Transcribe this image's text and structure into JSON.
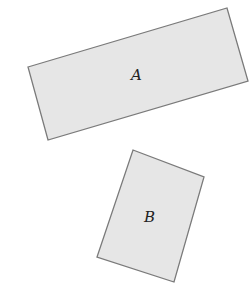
{
  "diagram": {
    "shapes": [
      {
        "id": "A",
        "label": "A",
        "points": "28,67 227,8 248,81 48,140",
        "label_x": 135,
        "label_y": 80
      },
      {
        "id": "B",
        "label": "B",
        "points": "133,150 204,177 174,282 97,257",
        "label_x": 150,
        "label_y": 222
      }
    ],
    "colors": {
      "fill": "#e6e6e6",
      "stroke": "#7a7a7a"
    }
  }
}
